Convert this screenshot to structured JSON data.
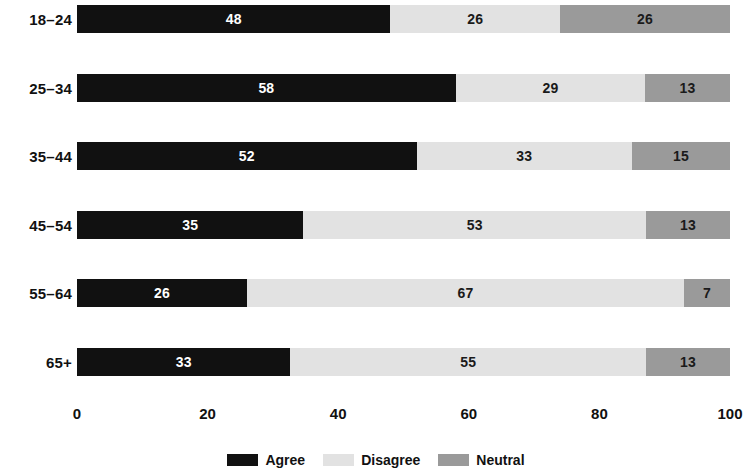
{
  "chart_data": {
    "type": "bar",
    "subtype": "stacked-horizontal-bar",
    "title": "",
    "xlabel": "",
    "ylabel": "",
    "xlim": [
      0,
      100
    ],
    "xticks": [
      "0",
      "20",
      "40",
      "60",
      "80",
      "100"
    ],
    "xtick_values": [
      0,
      20,
      40,
      60,
      80,
      100
    ],
    "grid": false,
    "legend_position": "bottom-center",
    "categories": [
      "18–24",
      "25–34",
      "35–44",
      "45–54",
      "55–64",
      "65+"
    ],
    "series": [
      {
        "name": "Agree",
        "color": "#111111",
        "values": [
          48,
          58,
          52,
          35,
          26,
          33
        ]
      },
      {
        "name": "Disagree",
        "color": "#e2e2e2",
        "values": [
          26,
          29,
          33,
          53,
          67,
          55
        ]
      },
      {
        "name": "Neutral",
        "color": "#9a9a9a",
        "values": [
          26,
          13,
          15,
          13,
          7,
          13
        ]
      }
    ],
    "rows": [
      {
        "category": "18–24",
        "agree": 48,
        "disagree": 26,
        "neutral": 26
      },
      {
        "category": "25–34",
        "agree": 58,
        "disagree": 29,
        "neutral": 13
      },
      {
        "category": "35–44",
        "agree": 52,
        "disagree": 33,
        "neutral": 15
      },
      {
        "category": "45–54",
        "agree": 35,
        "disagree": 53,
        "neutral": 13
      },
      {
        "category": "55–64",
        "agree": 26,
        "disagree": 67,
        "neutral": 7
      },
      {
        "category": "65+",
        "agree": 33,
        "disagree": 55,
        "neutral": 13
      }
    ]
  },
  "legend": {
    "items": [
      {
        "label": "Agree",
        "color": "#111111"
      },
      {
        "label": "Disagree",
        "color": "#e2e2e2"
      },
      {
        "label": "Neutral",
        "color": "#9a9a9a"
      }
    ]
  }
}
